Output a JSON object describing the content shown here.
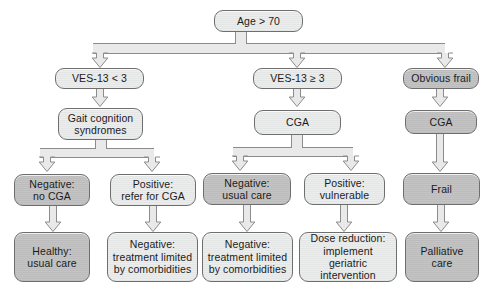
{
  "diagram": {
    "colors": {
      "box_light_fill": "#e8e9e9",
      "box_dark_fill": "#c0c0c0",
      "box_border": "#6e6e6e",
      "connector_fill": "#e9e9e9",
      "connector_border": "#8c8c8c",
      "text": "#1b1b1b",
      "background": "#ffffff"
    },
    "nodes": [
      {
        "id": "root",
        "lines": [
          "Age > 70"
        ],
        "shade": "light"
      },
      {
        "id": "ves_lt3",
        "lines": [
          "VES-13 < 3"
        ],
        "shade": "light"
      },
      {
        "id": "ves_ge3",
        "lines": [
          "VES-13 ≥ 3"
        ],
        "shade": "light"
      },
      {
        "id": "obvious",
        "lines": [
          "Obvious frail"
        ],
        "shade": "dark"
      },
      {
        "id": "gait",
        "lines": [
          "Gait cognition",
          "syndromes"
        ],
        "shade": "light"
      },
      {
        "id": "cga_mid",
        "lines": [
          "CGA"
        ],
        "shade": "light"
      },
      {
        "id": "cga_right",
        "lines": [
          "CGA"
        ],
        "shade": "dark"
      },
      {
        "id": "neg_nocga",
        "lines": [
          "Negative:",
          "no CGA"
        ],
        "shade": "dark"
      },
      {
        "id": "pos_refer",
        "lines": [
          "Positive:",
          "refer for CGA"
        ],
        "shade": "light"
      },
      {
        "id": "neg_usual",
        "lines": [
          "Negative:",
          "usual care"
        ],
        "shade": "dark"
      },
      {
        "id": "pos_vuln",
        "lines": [
          "Positive:",
          "vulnerable"
        ],
        "shade": "light"
      },
      {
        "id": "frail",
        "lines": [
          "Frail"
        ],
        "shade": "dark"
      },
      {
        "id": "healthy",
        "lines": [
          "Healthy:",
          "usual care"
        ],
        "shade": "dark"
      },
      {
        "id": "neg_comorb1",
        "lines": [
          "Negative:",
          "treatment limited",
          "by comorbidities"
        ],
        "shade": "light"
      },
      {
        "id": "neg_comorb2",
        "lines": [
          "Negative:",
          "treatment limited",
          "by comorbidities"
        ],
        "shade": "light"
      },
      {
        "id": "dose",
        "lines": [
          "Dose reduction:",
          "implement geriatric",
          "intervention"
        ],
        "shade": "light"
      },
      {
        "id": "palliative",
        "lines": [
          "Palliative",
          "care"
        ],
        "shade": "dark"
      }
    ],
    "edges": [
      {
        "from": "root",
        "to": "ves_lt3"
      },
      {
        "from": "root",
        "to": "ves_ge3"
      },
      {
        "from": "root",
        "to": "obvious"
      },
      {
        "from": "ves_lt3",
        "to": "gait"
      },
      {
        "from": "ves_ge3",
        "to": "cga_mid"
      },
      {
        "from": "obvious",
        "to": "cga_right"
      },
      {
        "from": "gait",
        "to": "neg_nocga"
      },
      {
        "from": "gait",
        "to": "pos_refer"
      },
      {
        "from": "cga_mid",
        "to": "neg_usual"
      },
      {
        "from": "cga_mid",
        "to": "pos_vuln"
      },
      {
        "from": "cga_right",
        "to": "frail"
      },
      {
        "from": "neg_nocga",
        "to": "healthy"
      },
      {
        "from": "pos_refer",
        "to": "neg_comorb1"
      },
      {
        "from": "neg_usual",
        "to": "neg_comorb2"
      },
      {
        "from": "pos_vuln",
        "to": "dose"
      },
      {
        "from": "frail",
        "to": "palliative"
      }
    ]
  }
}
